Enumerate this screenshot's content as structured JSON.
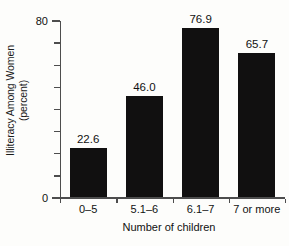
{
  "chart_data": {
    "type": "bar",
    "title": "",
    "subtitle": "",
    "categories": [
      "0–5",
      "5.1–6",
      "6.1–7",
      "7 or more"
    ],
    "values": [
      22.6,
      46.0,
      76.9,
      65.7
    ],
    "data_labels": [
      "22.6",
      "46.0",
      "76.9",
      "65.7"
    ],
    "xlabel": "Number of children",
    "ylabel": "Illiteracy Among Women (percent)",
    "ylabel_line1": "Illiteracy Among Women",
    "ylabel_line2": "(percent)",
    "ylim": [
      0,
      80
    ],
    "ytick_values": [
      0,
      10,
      20,
      30,
      40,
      50,
      60,
      70,
      80
    ],
    "ytick_labels_shown": [
      "0",
      "80"
    ],
    "ytick_label_min": "0",
    "ytick_label_max": "80",
    "grid": false,
    "legend": false,
    "legend_position": "none",
    "bar_color": "#111010",
    "axis_color": "#4d4d4d",
    "text_color": "#111111",
    "background_color": "#fdfdfb"
  }
}
